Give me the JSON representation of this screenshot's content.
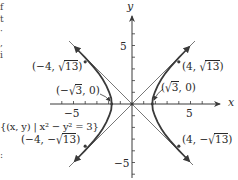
{
  "figure": {
    "type": "hyperbola-graph",
    "equation_label": "{(x, y) | x² − y² = 3}",
    "equation": "x^2 - y^2 = 3",
    "axes": {
      "x_label": "x",
      "y_label": "y",
      "x_ticks_labeled": [
        "−5",
        "5"
      ],
      "y_ticks_labeled": [
        "5",
        "−5"
      ],
      "x_range": [
        -5.5,
        7.5
      ],
      "y_range": [
        -6,
        7.5
      ]
    },
    "asymptotes": [
      "y = x",
      "y = −x"
    ],
    "points": [
      {
        "label_prefix": "(−4, ",
        "radicand": "13",
        "label_suffix": ")",
        "x": -4,
        "y": "sqrt(13)"
      },
      {
        "label_prefix": "(4, ",
        "radicand": "13",
        "label_suffix": ")",
        "x": 4,
        "y": "sqrt(13)"
      },
      {
        "label_prefix": "(−",
        "radicand": "3",
        "label_suffix": ", 0)",
        "x": "-sqrt(3)",
        "y": 0
      },
      {
        "label_prefix": "(",
        "radicand": "3",
        "label_suffix": ", 0)",
        "x": "sqrt(3)",
        "y": 0
      },
      {
        "label_prefix": "(−4, −",
        "radicand": "13",
        "label_suffix": ")",
        "x": -4,
        "y": "-sqrt(13)"
      },
      {
        "label_prefix": "(4, −",
        "radicand": "13",
        "label_suffix": ")",
        "x": 4,
        "y": "-sqrt(13)"
      }
    ],
    "colors": {
      "curve": "#3a3a3a",
      "asymptote": "#555555",
      "axis": "#3a3a3a",
      "background": "#ffffff"
    }
  },
  "edge_text": {
    "fragments": [
      "f",
      "t",
      "·",
      ",",
      "i",
      ":"
    ]
  }
}
